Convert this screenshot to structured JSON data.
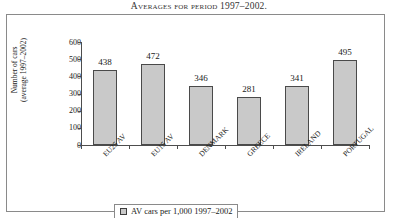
{
  "caption": "Averages for period 1997–2002.",
  "chart_data": {
    "type": "bar",
    "title": "",
    "categories": [
      "EU25 AV",
      "EU15 AV",
      "DENMARK",
      "GREECE",
      "IRELAND",
      "PORTUGAL"
    ],
    "values": [
      438,
      472,
      346,
      281,
      341,
      495
    ],
    "xlabel": "",
    "ylabel_line1": "Number of cars",
    "ylabel_line2": "(average 1997–2002)",
    "ylim": [
      0,
      600
    ],
    "yticks": [
      600,
      500,
      400,
      300,
      200,
      100,
      0
    ],
    "grid": false,
    "legend_position": "bottom",
    "series": [
      {
        "name": "AV cars per 1,000 1997–2002",
        "values": [
          438,
          472,
          346,
          281,
          341,
          495
        ]
      }
    ],
    "colors": {
      "bar_fill": "#c9c9c9",
      "bar_border": "#4a4a4a",
      "axis": "#4d4d4d",
      "frame": "#8a8a8a"
    }
  },
  "legend": {
    "label": "AV cars per 1,000 1997–2002"
  }
}
